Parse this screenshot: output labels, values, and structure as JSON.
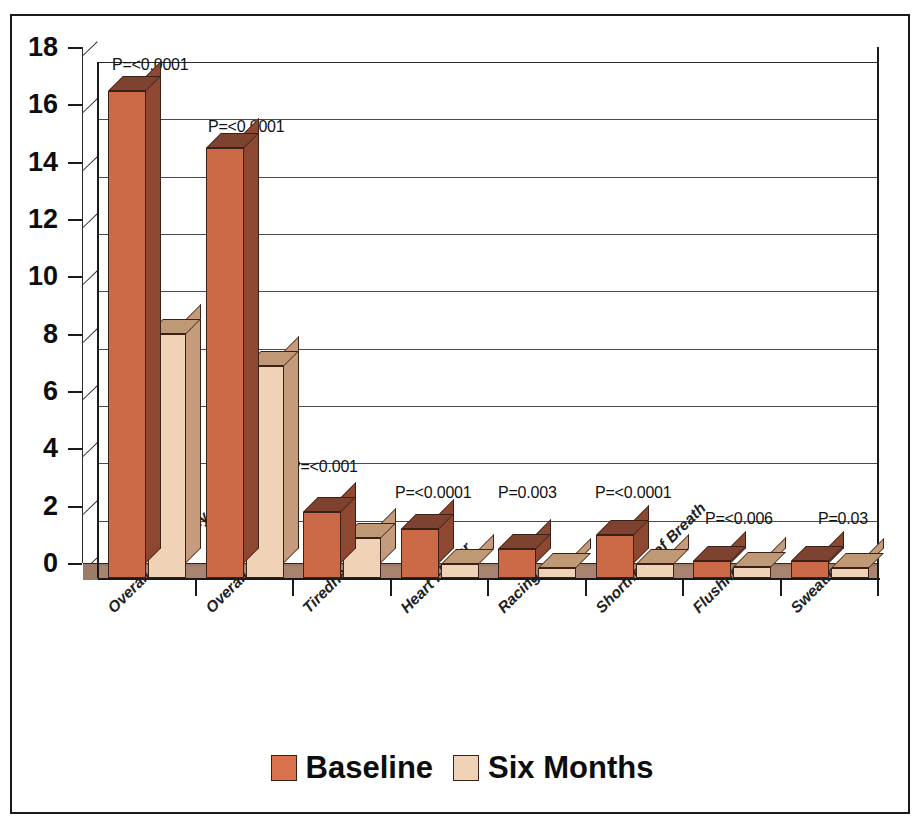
{
  "chart_data": {
    "type": "bar",
    "title": "",
    "xlabel": "",
    "ylabel": "",
    "ylim": [
      0,
      18
    ],
    "ytick_step": 2,
    "yticks": [
      "0",
      "2",
      "4",
      "6",
      "8",
      "10",
      "12",
      "14",
      "16",
      "18"
    ],
    "grid": true,
    "legend_position": "bottom",
    "categories": [
      "Overall Frequency",
      "Overall Severity",
      "Tiredness",
      "Heart Flutter",
      "Racing",
      "Shortness of Breath",
      "Flushness",
      "Sweating"
    ],
    "series": [
      {
        "name": "Baseline",
        "color": "#cc6a47",
        "values": [
          17.0,
          15.0,
          2.3,
          1.7,
          1.0,
          1.5,
          0.6,
          0.6
        ]
      },
      {
        "name": "Six Months",
        "color": "#f0d2b6",
        "values": [
          8.5,
          7.4,
          1.4,
          0.5,
          0.35,
          0.5,
          0.4,
          0.35
        ]
      }
    ],
    "annotations": [
      "P=<0.0001",
      "P=<0.0001",
      "P=<0.001",
      "P=<0.0001",
      "P=0.003",
      "P=<0.0001",
      "P=<0.006",
      "P=0.03"
    ]
  },
  "legend": {
    "items": [
      {
        "label": "Baseline",
        "swatch": "baseline-swatch"
      },
      {
        "label": "Six Months",
        "swatch": "six-months-swatch"
      }
    ]
  }
}
